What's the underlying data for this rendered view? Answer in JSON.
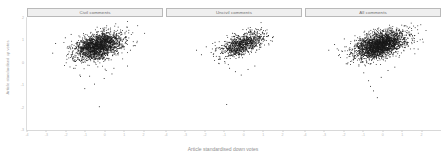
{
  "figure": {
    "width": 446,
    "height": 162,
    "background": "#ffffff",
    "point_color": "#1a1a1a",
    "strip_fill": "#efefef",
    "strip_border": "#b9b9b9",
    "axis_color": "#d8d8d8"
  },
  "chart_data": {
    "type": "scatter",
    "title": "",
    "xlabel": "Article standardised down votes",
    "ylabel": "Article standardised up votes",
    "xlim": [
      -4,
      3
    ],
    "ylim": [
      -3,
      2
    ],
    "xticks": [
      -4,
      -3,
      -2,
      -1,
      0,
      1,
      2
    ],
    "xticklabels": [
      "-4",
      "-3",
      "-2",
      "-1",
      "0",
      "1",
      "2"
    ],
    "yticks": [
      -3,
      -2,
      -1,
      0,
      1,
      2
    ],
    "yticklabels": [
      "-3",
      "-2",
      "-1",
      "0",
      "1",
      "2"
    ],
    "grid": false,
    "legend": "none",
    "facet_layout": "1x3",
    "panels": [
      {
        "label": "Civil comments",
        "n_points": 2100,
        "center": [
          -0.35,
          0.72
        ],
        "sd": [
          0.62,
          0.3
        ],
        "correlation": 0.42,
        "outliers": [
          [
            -2.55,
            0.85
          ],
          [
            -2.7,
            0.42
          ],
          [
            -2.05,
            1.1
          ],
          [
            -1.75,
            1.25
          ],
          [
            -1.55,
            -0.25
          ],
          [
            -1.3,
            -0.55
          ],
          [
            -1.05,
            -1.15
          ],
          [
            -0.8,
            -0.6
          ],
          [
            -0.55,
            -0.95
          ],
          [
            -0.3,
            -1.95
          ],
          [
            0.05,
            -0.35
          ],
          [
            0.35,
            -0.5
          ],
          [
            0.7,
            1.3
          ],
          [
            1.05,
            1.15
          ],
          [
            1.3,
            0.55
          ],
          [
            1.55,
            0.75
          ],
          [
            0.45,
            -0.25
          ],
          [
            -0.05,
            -0.7
          ],
          [
            1.15,
            -0.15
          ],
          [
            -1.95,
            0.65
          ]
        ]
      },
      {
        "label": "Uncivil comments",
        "n_points": 950,
        "center": [
          -0.1,
          0.8
        ],
        "sd": [
          0.58,
          0.28
        ],
        "correlation": 0.58,
        "outliers": [
          [
            -2.45,
            0.55
          ],
          [
            -2.2,
            0.35
          ],
          [
            -1.95,
            0.7
          ],
          [
            -1.7,
            0.45
          ],
          [
            -1.5,
            0.9
          ],
          [
            -1.25,
            0.25
          ],
          [
            -1.0,
            0.05
          ],
          [
            -0.75,
            -0.25
          ],
          [
            -0.45,
            -0.4
          ],
          [
            -0.15,
            -0.55
          ],
          [
            0.2,
            -0.3
          ],
          [
            0.55,
            -0.15
          ],
          [
            0.95,
            1.35
          ],
          [
            1.25,
            1.2
          ],
          [
            1.45,
            0.95
          ],
          [
            -0.9,
            -1.85
          ],
          [
            0.3,
            1.45
          ],
          [
            -0.6,
            1.3
          ]
        ]
      },
      {
        "label": "All comments",
        "n_points": 2600,
        "center": [
          -0.15,
          0.78
        ],
        "sd": [
          0.66,
          0.3
        ],
        "correlation": 0.47,
        "outliers": [
          [
            -2.8,
            0.55
          ],
          [
            -2.5,
            0.8
          ],
          [
            -2.25,
            0.35
          ],
          [
            -2.0,
            1.05
          ],
          [
            -1.75,
            0.6
          ],
          [
            -1.5,
            0.25
          ],
          [
            -1.25,
            -0.15
          ],
          [
            -1.0,
            -0.45
          ],
          [
            -0.75,
            -0.8
          ],
          [
            -0.5,
            -1.25
          ],
          [
            -0.3,
            -1.55
          ],
          [
            -0.1,
            -0.65
          ],
          [
            0.25,
            -0.35
          ],
          [
            0.6,
            -0.2
          ],
          [
            1.0,
            1.4
          ],
          [
            1.35,
            1.2
          ],
          [
            1.6,
            0.9
          ],
          [
            1.8,
            0.6
          ],
          [
            -0.65,
            -1.05
          ],
          [
            0.45,
            1.45
          ],
          [
            -1.9,
            -0.05
          ]
        ]
      }
    ]
  }
}
